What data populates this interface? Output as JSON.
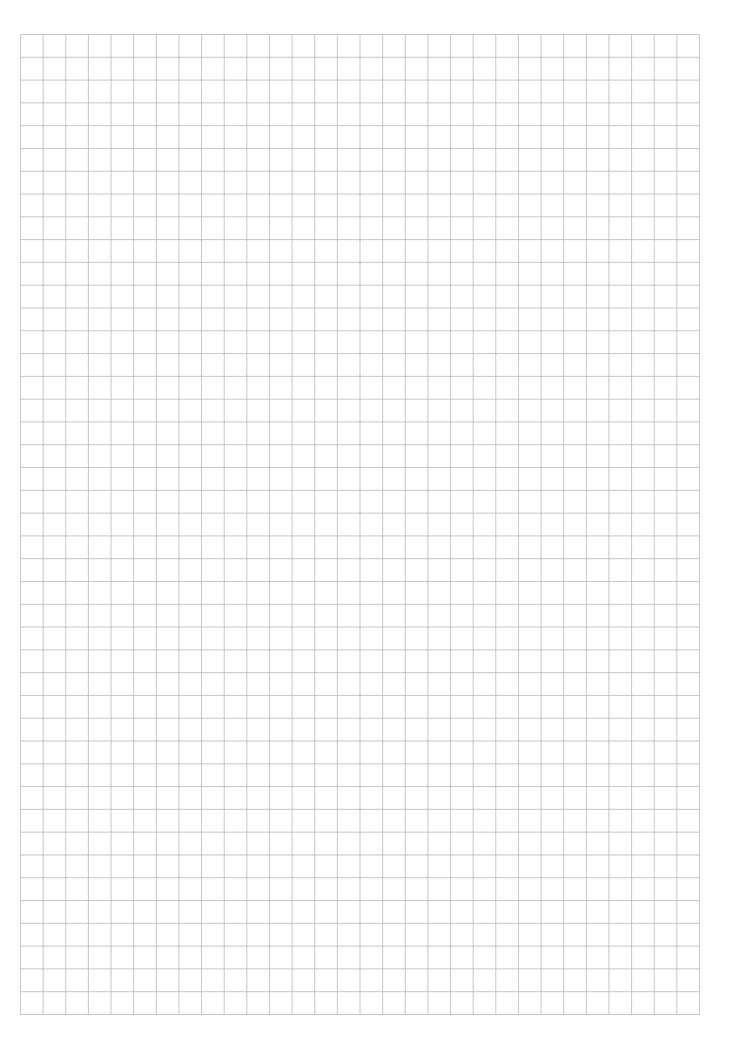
{
  "document": {
    "type": "grid paper",
    "columns": 30,
    "rows": 43,
    "line_color": "#b8b8b8",
    "background_color": "#ffffff"
  }
}
